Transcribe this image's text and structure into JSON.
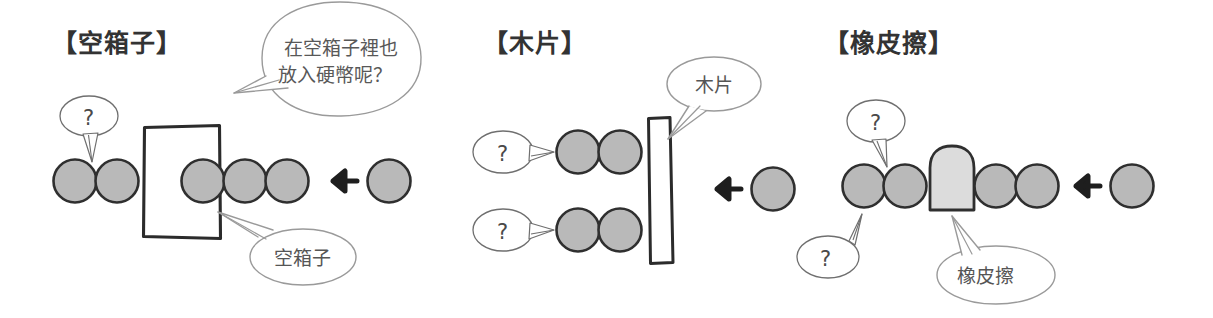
{
  "figure": {
    "kind": "hand-drawn-science-diagram",
    "background_color": "#ffffff",
    "ink_color": "#2b2b2b",
    "bubble_line_color": "#8c8c8c",
    "coin_fill": "#b9b9b9",
    "eraser_fill": "#dcdcdc",
    "obstacle_fill": "#ffffff"
  },
  "panels": [
    {
      "id": "empty-box",
      "title": "【空箱子】",
      "obstacle_label": "空箱子",
      "question_marks": [
        "?"
      ],
      "incoming_arrow": "←",
      "coins_left": 2,
      "coins_right": 3,
      "incoming_coins": 1
    },
    {
      "id": "wood-chip",
      "title": "【木片】",
      "obstacle_label": "木片",
      "question_marks": [
        "?",
        "?"
      ],
      "incoming_arrow": "←",
      "rows": 2,
      "coins_per_row": 2,
      "incoming_coins": 1
    },
    {
      "id": "eraser",
      "title": "【橡皮擦】",
      "obstacle_label": "橡皮擦",
      "question_marks": [
        "?",
        "?"
      ],
      "incoming_arrow": "←",
      "coins_left": 2,
      "coins_right": 2,
      "incoming_coins": 1
    }
  ],
  "speech": {
    "line1": "在空箱子裡也",
    "line2": "放入硬幣呢？"
  }
}
